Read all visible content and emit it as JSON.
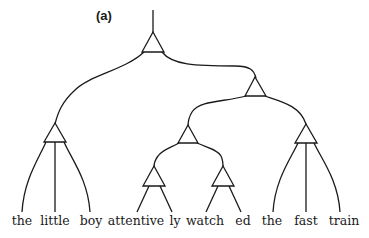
{
  "figure": {
    "label": "(a)",
    "type": "tree diagram",
    "node_shape": "triangle",
    "words": [
      "the",
      "little",
      "boy",
      "attentive",
      "ly",
      "watch",
      "ed",
      "the",
      "fast",
      "train"
    ],
    "structure": {
      "root": {
        "children": [
          {
            "name": "np-the-little-boy",
            "leaves": [
              "the",
              "little",
              "boy"
            ]
          },
          {
            "name": "vp",
            "children": [
              {
                "name": "verb-group",
                "children": [
                  {
                    "name": "adv",
                    "leaves": [
                      "attentive",
                      "ly"
                    ]
                  },
                  {
                    "name": "verb",
                    "leaves": [
                      "watch",
                      "ed"
                    ]
                  }
                ]
              },
              {
                "name": "np-the-fast-train",
                "leaves": [
                  "the",
                  "fast",
                  "train"
                ]
              }
            ]
          }
        ]
      }
    },
    "colors": {
      "stroke": "#1a1a1a",
      "background": "#ffffff"
    }
  }
}
